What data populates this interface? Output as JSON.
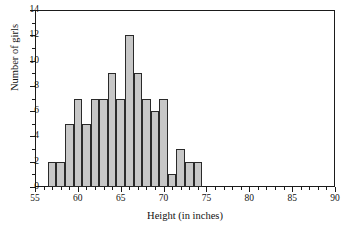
{
  "chart_data": {
    "type": "bar",
    "title": "",
    "subtitle": "",
    "xlabel": "Height (in inches)",
    "ylabel": "Number of girls",
    "xlim": [
      55,
      90
    ],
    "ylim": [
      0,
      14
    ],
    "grid": false,
    "legend": null,
    "bin_width": 1,
    "bin_edges": [
      56.5,
      57.5,
      58.5,
      59.5,
      60.5,
      61.5,
      62.5,
      63.5,
      64.5,
      65.5,
      66.5,
      67.5,
      68.5,
      69.5,
      70.5,
      71.5,
      72.5,
      73.5,
      74.5
    ],
    "categories": [
      "56.5-57.5",
      "57.5-58.5",
      "58.5-59.5",
      "59.5-60.5",
      "60.5-61.5",
      "61.5-62.5",
      "62.5-63.5",
      "63.5-64.5",
      "64.5-65.5",
      "65.5-66.5",
      "66.5-67.5",
      "67.5-68.5",
      "68.5-69.5",
      "69.5-70.5",
      "70.5-71.5",
      "71.5-72.5",
      "72.5-73.5",
      "73.5-74.5"
    ],
    "values": [
      2,
      2,
      5,
      7,
      5,
      7,
      7,
      9,
      7,
      12,
      9,
      7,
      6,
      7,
      1,
      3,
      2,
      2
    ],
    "total": 100,
    "x_ticks_major": [
      55,
      60,
      65,
      70,
      75,
      80,
      85,
      90
    ],
    "x_tick_labels": [
      "55",
      "60",
      "65",
      "70",
      "75",
      "80",
      "85",
      "90"
    ],
    "x_ticks_minor": [
      56,
      57,
      58,
      59,
      61,
      62,
      63,
      64,
      66,
      67,
      68,
      69,
      71,
      72,
      73,
      74,
      76,
      77,
      78,
      79,
      81,
      82,
      83,
      84,
      86,
      87,
      88,
      89
    ],
    "y_ticks_major": [
      0,
      2,
      4,
      6,
      8,
      10,
      12,
      14
    ],
    "y_tick_labels": [
      "0",
      "2",
      "4",
      "6",
      "8",
      "10",
      "12",
      "14"
    ],
    "y_ticks_minor": [
      1,
      3,
      5,
      7,
      9,
      11,
      13
    ],
    "bar_fill_color": "#c7c7c7",
    "bar_edge_color": "#2a2a2a",
    "axis_color": "#1b1b1b",
    "background_color": "#ffffff"
  }
}
